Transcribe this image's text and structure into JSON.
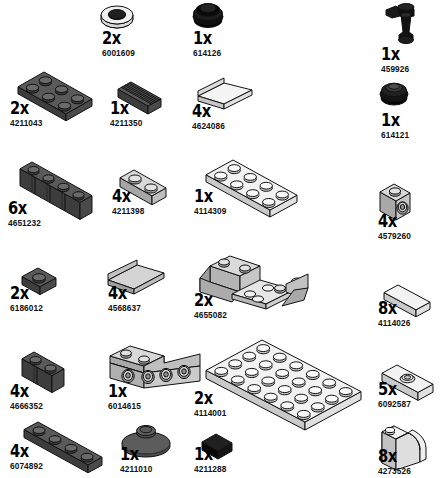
{
  "document": {
    "kind": "lego-parts-inventory",
    "title": "",
    "width": 444,
    "height": 478,
    "background": "#ffffff"
  },
  "palette": {
    "black": "#1a1a1a",
    "black_dark": "#000000",
    "dark_gray": "#5a5a5a",
    "dark_gray_shade": "#4a4a4a",
    "dark_gray_dark": "#3d3d3d",
    "light_gray": "#d8d8d8",
    "light_gray_shade": "#bdbdbd",
    "light_gray_dark": "#a6a6a6",
    "white_face": "#f2f2f2",
    "outline": "#111111",
    "text": "#000000"
  },
  "units": {
    "qty_suffix": "x"
  },
  "parts": [
    {
      "id": "p1",
      "name": "wheel-tire-ring",
      "qty": "2x",
      "code": "6001609",
      "color": "black",
      "x": 96,
      "y": 2,
      "label_x": 102,
      "label_y": 30
    },
    {
      "id": "p2",
      "name": "tire-small-black",
      "qty": "1x",
      "code": "614126",
      "color": "black",
      "x": 188,
      "y": 2,
      "label_x": 193,
      "label_y": 30
    },
    {
      "id": "p3",
      "name": "tap-faucet-black",
      "qty": "1x",
      "code": "459926",
      "color": "black",
      "x": 380,
      "y": 2,
      "label_x": 381,
      "label_y": 46
    },
    {
      "id": "p4",
      "name": "plate-2x3-dark-gray",
      "qty": "2x",
      "code": "4211043",
      "color": "dark_gray",
      "x": 8,
      "y": 62,
      "label_x": 10,
      "label_y": 100
    },
    {
      "id": "p5",
      "name": "tile-1x2-grille-dark-gray",
      "qty": "1x",
      "code": "4211350",
      "color": "dark_gray",
      "x": 108,
      "y": 72,
      "label_x": 110,
      "label_y": 100
    },
    {
      "id": "p6",
      "name": "slope-2x2-white",
      "qty": "4x",
      "code": "4624086",
      "color": "white_face",
      "x": 194,
      "y": 70,
      "label_x": 192,
      "label_y": 103
    },
    {
      "id": "p7",
      "name": "tire-small-black-2",
      "qty": "1x",
      "code": "614121",
      "color": "black",
      "x": 376,
      "y": 80,
      "label_x": 381,
      "label_y": 112
    },
    {
      "id": "p8",
      "name": "brick-1x4-masonry-dark",
      "qty": "6x",
      "code": "4651232",
      "color": "dark_gray",
      "x": 10,
      "y": 152,
      "label_x": 8,
      "label_y": 200
    },
    {
      "id": "p9",
      "name": "plate-1x2-light-gray",
      "qty": "4x",
      "code": "4211398",
      "color": "light_gray",
      "x": 110,
      "y": 160,
      "label_x": 112,
      "label_y": 188
    },
    {
      "id": "p10",
      "name": "plate-2x4-white",
      "qty": "1x",
      "code": "4114309",
      "color": "white_face",
      "x": 196,
      "y": 150,
      "label_x": 194,
      "label_y": 188
    },
    {
      "id": "p11",
      "name": "brick-1x1-headlight",
      "qty": "4x",
      "code": "4579260",
      "color": "light_gray",
      "x": 374,
      "y": 176,
      "label_x": 378,
      "label_y": 213
    },
    {
      "id": "p12",
      "name": "plate-1x1-dark-gray",
      "qty": "2x",
      "code": "6186012",
      "color": "dark_gray",
      "x": 12,
      "y": 258,
      "label_x": 10,
      "label_y": 285
    },
    {
      "id": "p13",
      "name": "slope-2x2-light-gray",
      "qty": "4x",
      "code": "4568637",
      "color": "light_gray",
      "x": 104,
      "y": 252,
      "label_x": 108,
      "label_y": 285
    },
    {
      "id": "p14",
      "name": "slope-inverted-double-4x2",
      "qty": "2x",
      "code": "4655082",
      "color": "light_gray",
      "x": 196,
      "y": 248,
      "label_x": 194,
      "label_y": 292
    },
    {
      "id": "p15",
      "name": "tile-1x2-white",
      "qty": "8x",
      "code": "4114026",
      "color": "white_face",
      "x": 374,
      "y": 275,
      "label_x": 378,
      "label_y": 300
    },
    {
      "id": "p16",
      "name": "brick-1x2-masonry-dark",
      "qty": "4x",
      "code": "4666352",
      "color": "dark_gray",
      "x": 12,
      "y": 342,
      "label_x": 10,
      "label_y": 383
    },
    {
      "id": "p17",
      "name": "bracket-1x2-1x4-light-gray",
      "qty": "1x",
      "code": "6014615",
      "color": "light_gray",
      "x": 104,
      "y": 340,
      "label_x": 108,
      "label_y": 383
    },
    {
      "id": "p18",
      "name": "plate-4x6-white",
      "qty": "2x",
      "code": "4114001",
      "color": "white_face",
      "x": 196,
      "y": 330,
      "label_x": 194,
      "label_y": 390
    },
    {
      "id": "p19",
      "name": "plate-1x2-with-stud-white",
      "qty": "5x",
      "code": "6092587",
      "color": "white_face",
      "x": 372,
      "y": 355,
      "label_x": 378,
      "label_y": 381
    },
    {
      "id": "p20",
      "name": "plate-1x4-dark-gray",
      "qty": "4x",
      "code": "6074892",
      "color": "dark_gray",
      "x": 14,
      "y": 412,
      "label_x": 10,
      "label_y": 443
    },
    {
      "id": "p21",
      "name": "dish-radar-dark-gray",
      "qty": "1x",
      "code": "4211010",
      "color": "dark_gray",
      "x": 118,
      "y": 420,
      "label_x": 120,
      "label_y": 446
    },
    {
      "id": "p22",
      "name": "tile-1x1-black",
      "qty": "1x",
      "code": "4211288",
      "color": "black",
      "x": 196,
      "y": 428,
      "label_x": 194,
      "label_y": 446
    },
    {
      "id": "p23",
      "name": "brick-1x2x2-curved-white",
      "qty": "8x",
      "code": "4273526",
      "color": "white_face",
      "x": 376,
      "y": 418,
      "label_x": 378,
      "label_y": 448
    }
  ]
}
